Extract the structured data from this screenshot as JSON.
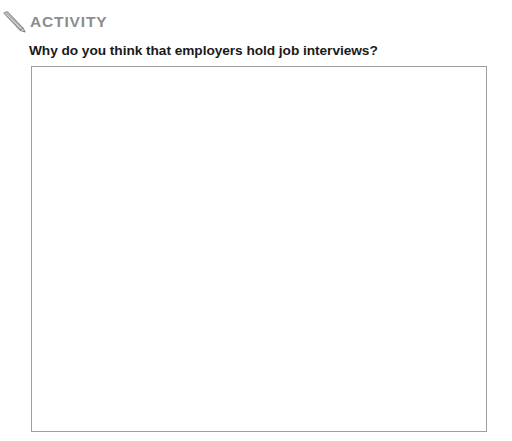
{
  "page": {
    "background_color": "#ffffff"
  },
  "activity": {
    "icon": "pencil-icon",
    "label": "ACTIVITY",
    "label_color": "#8c8c8c",
    "question": "Why do you think that employers hold job interviews?",
    "question_color": "#1a1a1a"
  },
  "answer_box": {
    "value": "",
    "placeholder": "",
    "border_color": "#9e9e9e",
    "background_color": "#ffffff"
  }
}
